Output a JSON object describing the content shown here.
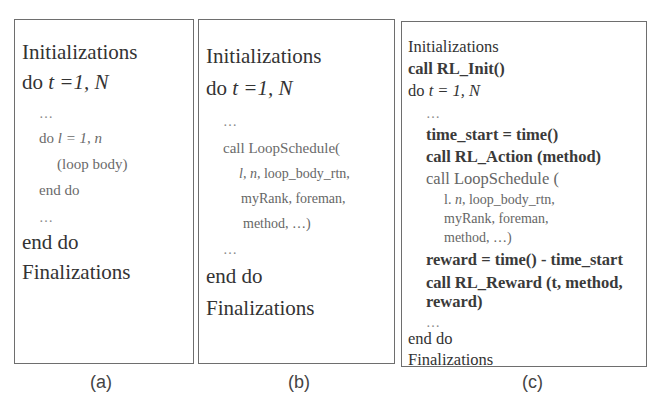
{
  "panels": {
    "a": {
      "caption": "(a)",
      "lines": {
        "l1": "Initializations",
        "l2_kw": "do ",
        "l2_var": "t =1, N",
        "l3": "…",
        "l4_kw": "do ",
        "l4_var": "l = 1, n",
        "l5": "(loop body)",
        "l6": "end do",
        "l7": "…",
        "l8": "end do",
        "l9": "Finalizations"
      }
    },
    "b": {
      "caption": "(b)",
      "lines": {
        "l1": "Initializations",
        "l2_kw": "do ",
        "l2_var": "t =1, N",
        "l3": "…",
        "l4": "call LoopSchedule(",
        "l5_var": "l, n,",
        "l5_rest": " loop_body_rtn,",
        "l6": "myRank, foreman,",
        "l7": "method, …)",
        "l8": "…",
        "l9": "end do",
        "l10": "Finalizations"
      }
    },
    "c": {
      "caption": "(c)",
      "lines": {
        "l1": "Initializations",
        "l2": "call RL_Init()",
        "l3_kw": "do ",
        "l3_var": "t  = 1, N",
        "l4": "…",
        "l5": "time_start = time()",
        "l6": "call RL_Action (method)",
        "l7": "call LoopSchedule (",
        "l8_pre": "l. ",
        "l8_var": "n",
        "l8_rest": ", loop_body_rtn,",
        "l9": "myRank, foreman,",
        "l10": "method, …)",
        "l11": "reward = time() - time_start",
        "l12": "call RL_Reward (t, method,",
        "l13": "reward)",
        "l14": "…",
        "l15": "end do",
        "l16": "Finalizations"
      }
    }
  }
}
